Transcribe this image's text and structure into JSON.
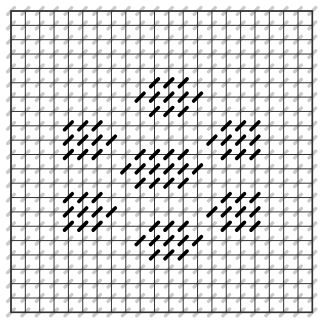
{
  "figure": {
    "title": "",
    "background_color": "#ffffff",
    "width": 325,
    "height": 322
  },
  "chart_data": {
    "type": "heatmap",
    "title": "",
    "subtitle": "",
    "xlabel": "",
    "ylabel": "",
    "grid": {
      "visible": true,
      "columns": 21,
      "rows": 21,
      "cell_size_px": 14.35,
      "origin_x_px": 11,
      "origin_y_px": 11,
      "line_color": "#333333",
      "line_width_px": 1.0,
      "border_color": "#333333",
      "border_width_px": 1.6
    },
    "marker": {
      "shape": "diagonal-dash",
      "angle_deg": -45,
      "length_px": 9.5,
      "thickness_px": 2.2,
      "inactive_color": "#c9c9c9",
      "inactive_thickness_px": 3.4,
      "active_color": "#000000",
      "active_thickness_px": 3.6,
      "active_length_px": 11
    },
    "legend": {
      "visible": false,
      "position": "none",
      "entries": [
        {
          "label": "inactive site",
          "color": "#c9c9c9"
        },
        {
          "label": "active site",
          "color": "#000000"
        }
      ]
    },
    "axis": {
      "x_ticks_visible": false,
      "y_ticks_visible": false,
      "xlim": [
        0,
        21
      ],
      "ylim": [
        0,
        21
      ]
    },
    "active_sites": [
      [
        10,
        5
      ],
      [
        11,
        5
      ],
      [
        12,
        5
      ],
      [
        9,
        6
      ],
      [
        10,
        6
      ],
      [
        11,
        6
      ],
      [
        12,
        6
      ],
      [
        13,
        6
      ],
      [
        10,
        7
      ],
      [
        11,
        7
      ],
      [
        12,
        7
      ],
      [
        4,
        8
      ],
      [
        5,
        8
      ],
      [
        6,
        8
      ],
      [
        15,
        8
      ],
      [
        16,
        8
      ],
      [
        17,
        8
      ],
      [
        4,
        9
      ],
      [
        5,
        9
      ],
      [
        6,
        9
      ],
      [
        7,
        9
      ],
      [
        14,
        9
      ],
      [
        15,
        9
      ],
      [
        16,
        9
      ],
      [
        17,
        9
      ],
      [
        4,
        10
      ],
      [
        5,
        10
      ],
      [
        6,
        10
      ],
      [
        15,
        10
      ],
      [
        16,
        10
      ],
      [
        17,
        10
      ],
      [
        9,
        10
      ],
      [
        10,
        10
      ],
      [
        11,
        10
      ],
      [
        12,
        10
      ],
      [
        8,
        11
      ],
      [
        9,
        11
      ],
      [
        10,
        11
      ],
      [
        11,
        11
      ],
      [
        12,
        11
      ],
      [
        13,
        11
      ],
      [
        9,
        12
      ],
      [
        10,
        12
      ],
      [
        11,
        12
      ],
      [
        12,
        12
      ],
      [
        4,
        13
      ],
      [
        5,
        13
      ],
      [
        6,
        13
      ],
      [
        15,
        13
      ],
      [
        16,
        13
      ],
      [
        17,
        13
      ],
      [
        4,
        14
      ],
      [
        5,
        14
      ],
      [
        6,
        14
      ],
      [
        7,
        14
      ],
      [
        14,
        14
      ],
      [
        15,
        14
      ],
      [
        16,
        14
      ],
      [
        17,
        14
      ],
      [
        4,
        15
      ],
      [
        5,
        15
      ],
      [
        6,
        15
      ],
      [
        15,
        15
      ],
      [
        16,
        15
      ],
      [
        17,
        15
      ],
      [
        10,
        15
      ],
      [
        11,
        15
      ],
      [
        12,
        15
      ],
      [
        9,
        16
      ],
      [
        10,
        16
      ],
      [
        11,
        16
      ],
      [
        12,
        16
      ],
      [
        13,
        16
      ],
      [
        10,
        17
      ],
      [
        11,
        17
      ],
      [
        12,
        17
      ]
    ]
  }
}
